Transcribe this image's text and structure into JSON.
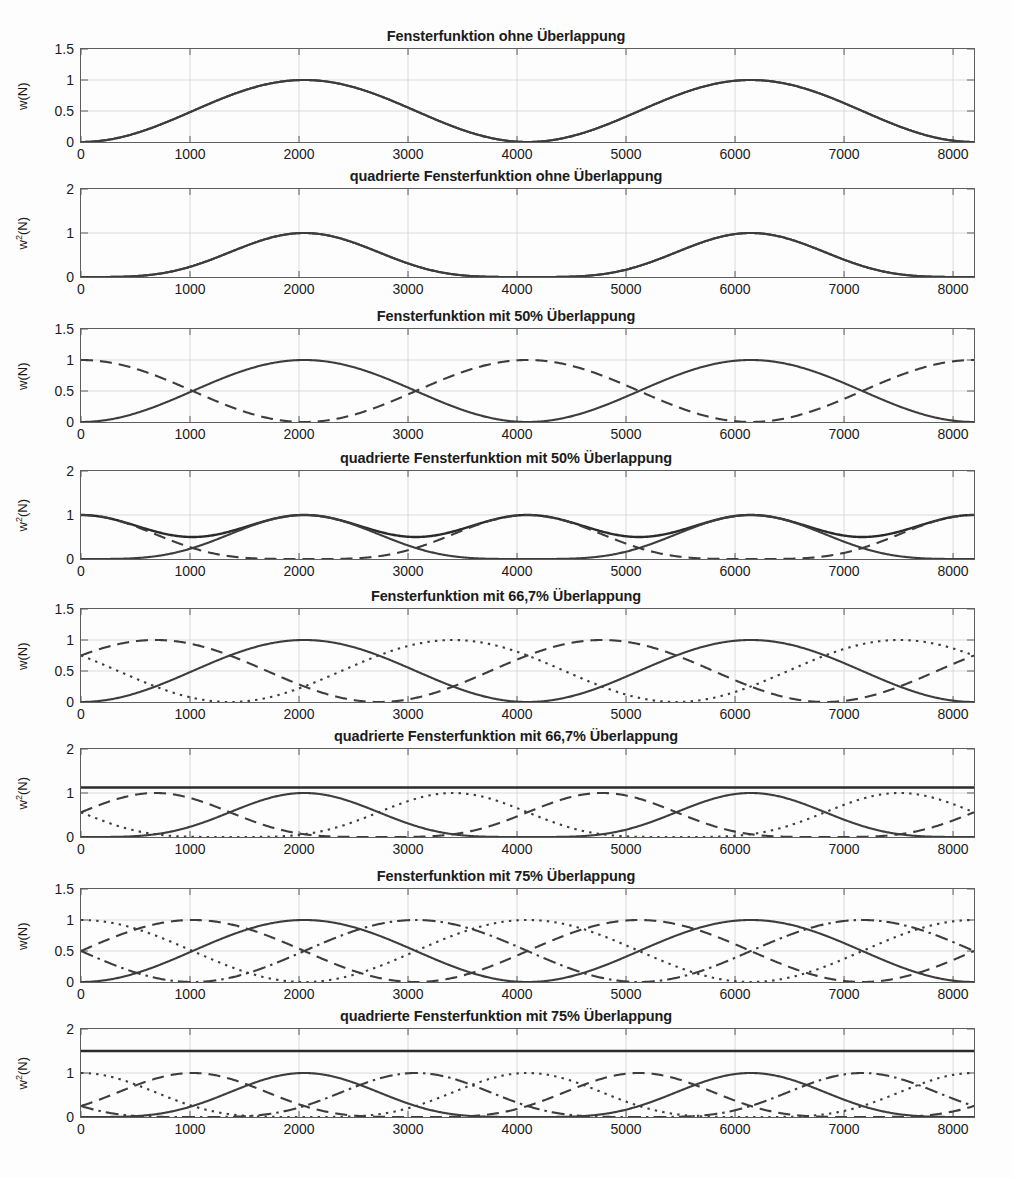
{
  "figure": {
    "background_color": "#fdfdfd",
    "line_color": "#3d3d3d",
    "grid_color": "#d2d2d2",
    "axis_color": "#5e5e5e"
  },
  "chart_data": [
    {
      "index": 0,
      "type": "line",
      "title": "Fensterfunktion ohne Überlappung",
      "xlabel": "",
      "ylabel": "w(N)",
      "ylabel_parts": {
        "base": "w",
        "sup": "",
        "tail": "(N)"
      },
      "xlim": [
        0,
        8192
      ],
      "ylim": [
        0,
        1.5
      ],
      "xticks": [
        0,
        1000,
        2000,
        3000,
        4000,
        5000,
        6000,
        7000,
        8000
      ],
      "xticklabels": [
        "0",
        "1000",
        "2000",
        "3000",
        "4000",
        "5000",
        "6000",
        "7000",
        "8000"
      ],
      "yticks": [
        0,
        0.5,
        1,
        1.5
      ],
      "yticklabels": [
        "0",
        "0.5",
        "1",
        "1.5"
      ],
      "grid": true,
      "overlap_percent": 0,
      "window_length": 4096,
      "hop": 4096,
      "squared": false,
      "show_sum": false,
      "series": [
        {
          "name": "Fenster 1",
          "style": "solid",
          "window_offset": 0,
          "peak": 1
        },
        {
          "name": "Fenster 2",
          "style": "solid",
          "window_offset": 4096,
          "peak": 1
        }
      ],
      "notes": "Hann-Fenster, Maxima bei 2048 und 6144, Nullstellen bei 0, 4096, 8192"
    },
    {
      "index": 1,
      "type": "line",
      "title": "quadrierte Fensterfunktion ohne Überlappung",
      "xlabel": "",
      "ylabel": "w²(N)",
      "ylabel_parts": {
        "base": "w",
        "sup": "2",
        "tail": "(N)"
      },
      "xlim": [
        0,
        8192
      ],
      "ylim": [
        0,
        2
      ],
      "xticks": [
        0,
        1000,
        2000,
        3000,
        4000,
        5000,
        6000,
        7000,
        8000
      ],
      "xticklabels": [
        "0",
        "1000",
        "2000",
        "3000",
        "4000",
        "5000",
        "6000",
        "7000",
        "8000"
      ],
      "yticks": [
        0,
        1,
        2
      ],
      "yticklabels": [
        "0",
        "1",
        "2"
      ],
      "grid": true,
      "overlap_percent": 0,
      "window_length": 4096,
      "hop": 4096,
      "squared": true,
      "show_sum": false,
      "series": [
        {
          "name": "Fenster 1",
          "style": "solid",
          "window_offset": 0,
          "peak": 1
        },
        {
          "name": "Fenster 2",
          "style": "solid",
          "window_offset": 4096,
          "peak": 1
        }
      ],
      "notes": "Quadrierte Hann-Fenster, Maxima 1 bei 2048 und 6144"
    },
    {
      "index": 2,
      "type": "line",
      "title": "Fensterfunktion mit 50% Überlappung",
      "xlabel": "",
      "ylabel": "w(N)",
      "ylabel_parts": {
        "base": "w",
        "sup": "",
        "tail": "(N)"
      },
      "xlim": [
        0,
        8192
      ],
      "ylim": [
        0,
        1.5
      ],
      "xticks": [
        0,
        1000,
        2000,
        3000,
        4000,
        5000,
        6000,
        7000,
        8000
      ],
      "xticklabels": [
        "0",
        "1000",
        "2000",
        "3000",
        "4000",
        "5000",
        "6000",
        "7000",
        "8000"
      ],
      "yticks": [
        0,
        0.5,
        1,
        1.5
      ],
      "yticklabels": [
        "0",
        "0.5",
        "1",
        "1.5"
      ],
      "grid": true,
      "overlap_percent": 50,
      "window_length": 4096,
      "hop": 2048,
      "squared": false,
      "show_sum": false,
      "series": [
        {
          "name": "Fenster 1",
          "style": "solid",
          "window_offset": 0,
          "peak": 1
        },
        {
          "name": "Fenster 2",
          "style": "dashed",
          "window_offset": 2048,
          "peak": 1
        }
      ],
      "notes": "Zwei um 2048 versetzte Hann-Fenster, Schnittpunkte bei 0,5"
    },
    {
      "index": 3,
      "type": "line",
      "title": "quadrierte Fensterfunktion mit 50% Überlappung",
      "xlabel": "",
      "ylabel": "w²(N)",
      "ylabel_parts": {
        "base": "w",
        "sup": "2",
        "tail": "(N)"
      },
      "xlim": [
        0,
        8192
      ],
      "ylim": [
        0,
        2
      ],
      "xticks": [
        0,
        1000,
        2000,
        3000,
        4000,
        5000,
        6000,
        7000,
        8000
      ],
      "xticklabels": [
        "0",
        "1000",
        "2000",
        "3000",
        "4000",
        "5000",
        "6000",
        "7000",
        "8000"
      ],
      "yticks": [
        0,
        1,
        2
      ],
      "yticklabels": [
        "0",
        "1",
        "2"
      ],
      "grid": true,
      "overlap_percent": 50,
      "window_length": 4096,
      "hop": 2048,
      "squared": true,
      "show_sum": true,
      "sum_value": null,
      "sum_min": 0.5,
      "sum_max": 1.0,
      "series": [
        {
          "name": "Fenster 1",
          "style": "solid",
          "window_offset": 0,
          "peak": 1
        },
        {
          "name": "Fenster 2",
          "style": "dashed",
          "window_offset": 2048,
          "peak": 1
        }
      ],
      "notes": "Summe der quadrierten Fenster schwankt zwischen 0,5 und 1"
    },
    {
      "index": 4,
      "type": "line",
      "title": "Fensterfunktion mit 66,7% Überlappung",
      "xlabel": "",
      "ylabel": "w(N)",
      "ylabel_parts": {
        "base": "w",
        "sup": "",
        "tail": "(N)"
      },
      "xlim": [
        0,
        8192
      ],
      "ylim": [
        0,
        1.5
      ],
      "xticks": [
        0,
        1000,
        2000,
        3000,
        4000,
        5000,
        6000,
        7000,
        8000
      ],
      "xticklabels": [
        "0",
        "1000",
        "2000",
        "3000",
        "4000",
        "5000",
        "6000",
        "7000",
        "8000"
      ],
      "yticks": [
        0,
        0.5,
        1,
        1.5
      ],
      "yticklabels": [
        "0",
        "0.5",
        "1",
        "1.5"
      ],
      "grid": true,
      "overlap_percent": 66.7,
      "window_length": 4096,
      "hop": 1365,
      "squared": false,
      "show_sum": false,
      "series": [
        {
          "name": "Fenster 1",
          "style": "solid",
          "window_offset": 0,
          "peak": 1
        },
        {
          "name": "Fenster 2",
          "style": "dashed",
          "window_offset": -1365,
          "peak": 1
        },
        {
          "name": "Fenster 3",
          "style": "dotted",
          "window_offset": 1365,
          "peak": 1
        }
      ],
      "notes": "Drei Hann-Fenster im Abstand von 1365 Punkten"
    },
    {
      "index": 5,
      "type": "line",
      "title": "quadrierte Fensterfunktion mit 66,7% Überlappung",
      "xlabel": "",
      "ylabel": "w²(N)",
      "ylabel_parts": {
        "base": "w",
        "sup": "2",
        "tail": "(N)"
      },
      "xlim": [
        0,
        8192
      ],
      "ylim": [
        0,
        2
      ],
      "xticks": [
        0,
        1000,
        2000,
        3000,
        4000,
        5000,
        6000,
        7000,
        8000
      ],
      "xticklabels": [
        "0",
        "1000",
        "2000",
        "3000",
        "4000",
        "5000",
        "6000",
        "7000",
        "8000"
      ],
      "yticks": [
        0,
        1,
        2
      ],
      "yticklabels": [
        "0",
        "1",
        "2"
      ],
      "grid": true,
      "overlap_percent": 66.7,
      "window_length": 4096,
      "hop": 1365,
      "squared": true,
      "show_sum": true,
      "sum_value": 1.125,
      "series": [
        {
          "name": "Fenster 1",
          "style": "solid",
          "window_offset": 0,
          "peak": 1
        },
        {
          "name": "Fenster 2",
          "style": "dashed",
          "window_offset": -1365,
          "peak": 1
        },
        {
          "name": "Fenster 3",
          "style": "dotted",
          "window_offset": 1365,
          "peak": 1
        }
      ],
      "notes": "Summe der quadrierten Fenster ist konstant 1,125"
    },
    {
      "index": 6,
      "type": "line",
      "title": "Fensterfunktion mit 75% Überlappung",
      "xlabel": "",
      "ylabel": "w(N)",
      "ylabel_parts": {
        "base": "w",
        "sup": "",
        "tail": "(N)"
      },
      "xlim": [
        0,
        8192
      ],
      "ylim": [
        0,
        1.5
      ],
      "xticks": [
        0,
        1000,
        2000,
        3000,
        4000,
        5000,
        6000,
        7000,
        8000
      ],
      "xticklabels": [
        "0",
        "1000",
        "2000",
        "3000",
        "4000",
        "5000",
        "6000",
        "7000",
        "8000"
      ],
      "yticks": [
        0,
        0.5,
        1,
        1.5
      ],
      "yticklabels": [
        "0",
        "0.5",
        "1",
        "1.5"
      ],
      "grid": true,
      "overlap_percent": 75,
      "window_length": 4096,
      "hop": 1024,
      "squared": false,
      "show_sum": false,
      "series": [
        {
          "name": "Fenster 1",
          "style": "solid",
          "window_offset": 0,
          "peak": 1
        },
        {
          "name": "Fenster 2",
          "style": "dashed",
          "window_offset": -1024,
          "peak": 1
        },
        {
          "name": "Fenster 3",
          "style": "dotted",
          "window_offset": -2048,
          "peak": 1
        },
        {
          "name": "Fenster 4",
          "style": "dashdot",
          "window_offset": 1024,
          "peak": 1
        }
      ],
      "notes": "Vier Hann-Fenster im Abstand von 1024 Punkten"
    },
    {
      "index": 7,
      "type": "line",
      "title": "quadrierte Fensterfunktion mit 75% Überlappung",
      "xlabel": "",
      "ylabel": "w²(N)",
      "ylabel_parts": {
        "base": "w",
        "sup": "2",
        "tail": "(N)"
      },
      "xlim": [
        0,
        8192
      ],
      "ylim": [
        0,
        2
      ],
      "xticks": [
        0,
        1000,
        2000,
        3000,
        4000,
        5000,
        6000,
        7000,
        8000
      ],
      "xticklabels": [
        "0",
        "1000",
        "2000",
        "3000",
        "4000",
        "5000",
        "6000",
        "7000",
        "8000"
      ],
      "yticks": [
        0,
        1,
        2
      ],
      "yticklabels": [
        "0",
        "1",
        "2"
      ],
      "grid": true,
      "overlap_percent": 75,
      "window_length": 4096,
      "hop": 1024,
      "squared": true,
      "show_sum": true,
      "sum_value": 1.5,
      "series": [
        {
          "name": "Fenster 1",
          "style": "solid",
          "window_offset": 0,
          "peak": 1
        },
        {
          "name": "Fenster 2",
          "style": "dashed",
          "window_offset": -1024,
          "peak": 1
        },
        {
          "name": "Fenster 3",
          "style": "dotted",
          "window_offset": -2048,
          "peak": 1
        },
        {
          "name": "Fenster 4",
          "style": "dashdot",
          "window_offset": 1024,
          "peak": 1
        }
      ],
      "notes": "Summe der quadrierten Fenster ist konstant 1,5"
    }
  ]
}
